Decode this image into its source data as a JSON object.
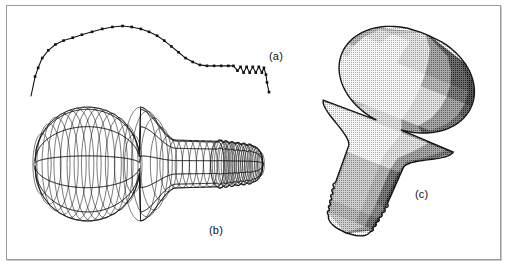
{
  "figure": {
    "background_color": "#ffffff",
    "frame_color": "#9a9a9a",
    "ink_color": "#111111"
  },
  "panels": [
    {
      "key": "profile",
      "label": "(a)",
      "caption": "generating profile curve with control points"
    },
    {
      "key": "wireframe",
      "label": "(b)",
      "caption": "wireframe surface of revolution"
    },
    {
      "key": "shaded",
      "label": "(c)",
      "caption": "flat-shaded halftone rendering"
    }
  ],
  "chart_data": {
    "type": "line",
    "title": "",
    "xlabel": "",
    "ylabel": "",
    "xlim": [
      0,
      236
    ],
    "ylim": [
      0,
      72
    ],
    "grid": false,
    "legend": "none",
    "marker": "square",
    "marker_size": 2.6,
    "line_color": "#111111",
    "marker_color": "#111111",
    "series": [
      {
        "name": "bulb profile",
        "x": [
          2,
          4,
          6,
          9,
          13,
          19,
          26,
          34,
          43,
          52,
          62,
          72,
          82,
          92,
          101,
          110,
          118,
          126,
          133,
          140,
          147,
          154,
          161,
          168,
          175,
          182,
          189,
          196,
          201,
          205,
          208,
          211,
          214,
          217,
          220,
          223,
          226,
          229,
          231,
          233,
          234,
          236
        ],
        "y": [
          0,
          10,
          20,
          29,
          39,
          47,
          53,
          57,
          60,
          63,
          66,
          69,
          71,
          72,
          71,
          69,
          66,
          62,
          57,
          51,
          45,
          39,
          35,
          32,
          31,
          31,
          31,
          31,
          31,
          26,
          30,
          24,
          30,
          24,
          30,
          24,
          30,
          24,
          29,
          22,
          14,
          4
        ]
      }
    ]
  }
}
